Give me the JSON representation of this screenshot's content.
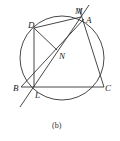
{
  "diagram": {
    "caption": "(b)",
    "points": {
      "M": {
        "label": "M",
        "x": 81,
        "y": 16
      },
      "A": {
        "label": "A",
        "x": 84,
        "y": 19
      },
      "D": {
        "label": "D",
        "x": 34,
        "y": 28
      },
      "N": {
        "label": "N",
        "x": 57,
        "y": 53
      },
      "B": {
        "label": "B",
        "x": 21,
        "y": 87
      },
      "L": {
        "label": "L",
        "x": 34,
        "y": 87
      },
      "C": {
        "label": "C",
        "x": 103,
        "y": 87
      }
    },
    "circle": {
      "cx": 62,
      "cy": 58,
      "r": 42
    },
    "segments": [
      [
        "D",
        "M"
      ],
      [
        "D",
        "L"
      ],
      [
        "D",
        "N"
      ],
      [
        "B",
        "C"
      ],
      [
        "A",
        "C"
      ],
      [
        "B",
        "A"
      ]
    ],
    "line_ML_extended": {
      "x1": 88,
      "y1": 6,
      "x2": 20,
      "y2": 107
    },
    "line_AM_extended": {
      "x1": 79,
      "y1": 8,
      "x2": 84,
      "y2": 19
    }
  }
}
